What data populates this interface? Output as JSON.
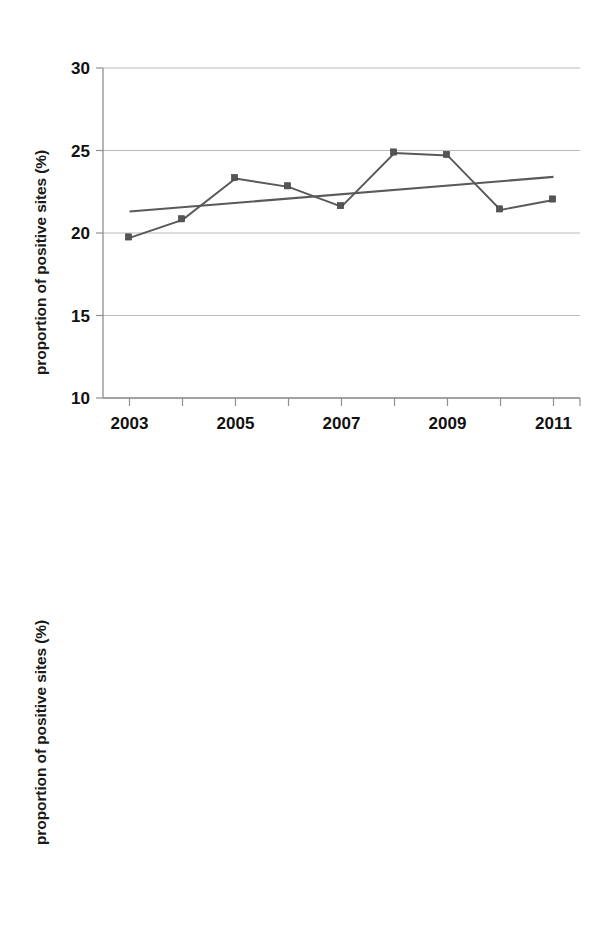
{
  "figure": {
    "panels": [
      {
        "id": "panel-top",
        "ylabel": "proportion of positive sites (%)",
        "yticks": [
          "30",
          "25",
          "20",
          "15",
          "10"
        ],
        "xticks": [
          "2003",
          "2005",
          "2007",
          "2009",
          "2011"
        ]
      },
      {
        "id": "panel-bottom",
        "ylabel": "proportion of positive sites (%)",
        "yticks": [
          "65",
          "60",
          "55",
          "50",
          "45"
        ],
        "xticks": [
          "2003",
          "2005",
          "2007",
          "2009",
          "2011"
        ]
      }
    ]
  },
  "chart_data": [
    {
      "type": "line",
      "title": "",
      "xlabel": "",
      "ylabel": "proportion of positive sites (%)",
      "x": [
        2003,
        2004,
        2005,
        2006,
        2007,
        2008,
        2009,
        2010,
        2011
      ],
      "xtick_labels": [
        "2003",
        "2005",
        "2007",
        "2009",
        "2011"
      ],
      "xtick_values": [
        2003,
        2005,
        2007,
        2009,
        2011
      ],
      "xlim": [
        2002.5,
        2011.5
      ],
      "ylim": [
        10,
        30
      ],
      "ytick_values": [
        10,
        15,
        20,
        25,
        30
      ],
      "grid": true,
      "grid_axis": "y",
      "marker": "square",
      "series": [
        {
          "name": "proportion of positive sites",
          "values": [
            19.7,
            20.8,
            23.3,
            22.8,
            21.6,
            24.85,
            24.7,
            21.4,
            22.0
          ]
        },
        {
          "name": "linear trend",
          "type": "trend",
          "x": [
            2003,
            2011
          ],
          "values": [
            21.3,
            23.4
          ]
        }
      ]
    },
    {
      "type": "line",
      "title": "",
      "xlabel": "",
      "ylabel": "proportion of positive sites (%)",
      "x": [
        2003,
        2004,
        2005,
        2006,
        2007,
        2008,
        2009,
        2010,
        2011
      ],
      "xtick_labels": [
        "2003",
        "2005",
        "2007",
        "2009",
        "2011"
      ],
      "xtick_values": [
        2003,
        2005,
        2007,
        2009,
        2011
      ],
      "xlim": [
        2002.5,
        2011.5
      ],
      "ylim": [
        45,
        65
      ],
      "ytick_values": [
        45,
        50,
        55,
        60,
        65
      ],
      "grid": true,
      "grid_axis": "y",
      "marker": "square",
      "series": [
        {
          "name": "proportion of positive sites",
          "values": [
            56.1,
            61.0,
            58.6,
            61.0,
            56.0,
            57.5,
            60.3,
            59.3,
            58.3
          ]
        },
        {
          "name": "linear trend",
          "type": "trend",
          "x": [
            2003,
            2011
          ],
          "values": [
            58.4,
            59.1
          ]
        }
      ]
    }
  ],
  "colors": {
    "series": "#595959",
    "trend": "#5a5a5a",
    "marker": "#555555",
    "grid": "#b9b9b9",
    "axis": "#8f8f8f",
    "text": "#111111"
  }
}
